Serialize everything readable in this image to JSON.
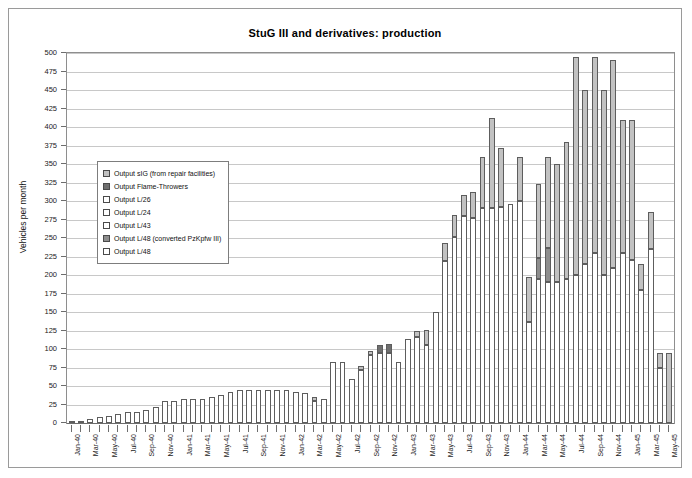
{
  "chart_data": {
    "type": "bar",
    "stacked": true,
    "title": "StuG III and derivatives: production",
    "xlabel": "",
    "ylabel": "Vehicles per month",
    "ylim": [
      0,
      500
    ],
    "ytick_step": 25,
    "yticks": [
      0,
      25,
      50,
      75,
      100,
      125,
      150,
      175,
      200,
      225,
      250,
      275,
      300,
      325,
      350,
      375,
      400,
      425,
      450,
      475,
      500
    ],
    "grid": true,
    "legend_position": "inside-left",
    "xtick_interval": 2,
    "categories": [
      "Jan-40",
      "Feb-40",
      "Mar-40",
      "Apr-40",
      "May-40",
      "Jun-40",
      "Jul-40",
      "Aug-40",
      "Sep-40",
      "Oct-40",
      "Nov-40",
      "Dec-40",
      "Jan-41",
      "Feb-41",
      "Mar-41",
      "Apr-41",
      "May-41",
      "Jun-41",
      "Jul-41",
      "Aug-41",
      "Sep-41",
      "Oct-41",
      "Nov-41",
      "Dec-41",
      "Jan-42",
      "Feb-42",
      "Mar-42",
      "Apr-42",
      "May-42",
      "Jun-42",
      "Jul-42",
      "Aug-42",
      "Sep-42",
      "Oct-42",
      "Nov-42",
      "Dec-42",
      "Jan-43",
      "Feb-43",
      "Mar-43",
      "Apr-43",
      "May-43",
      "Jun-43",
      "Jul-43",
      "Aug-43",
      "Sep-43",
      "Oct-43",
      "Nov-43",
      "Dec-43",
      "Jan-44",
      "Feb-44",
      "Mar-44",
      "Apr-44",
      "May-44",
      "Jun-44",
      "Jul-44",
      "Aug-44",
      "Sep-44",
      "Oct-44",
      "Nov-44",
      "Dec-44",
      "Jan-45",
      "Feb-45",
      "Mar-45",
      "Apr-45",
      "May-45"
    ],
    "series": [
      {
        "name": "Output L/48",
        "key": "l48",
        "fill": "#ffffff",
        "values": [
          2,
          3,
          5,
          8,
          10,
          12,
          15,
          15,
          18,
          22,
          30,
          30,
          32,
          32,
          32,
          35,
          38,
          42,
          45,
          45,
          45,
          45,
          45,
          45,
          42,
          40,
          30,
          32,
          82,
          83,
          60,
          72,
          92,
          95,
          95,
          83,
          113,
          116,
          106,
          150,
          219,
          251,
          280,
          277,
          290,
          290,
          292,
          296,
          300,
          137,
          195,
          190,
          190,
          195,
          200,
          215,
          230,
          200,
          210,
          230,
          220,
          180,
          235,
          75,
          0
        ]
      },
      {
        "name": "Output L/48 (converted PzKpfw III)",
        "key": "l48conv",
        "fill": "#8d8d8d",
        "values": [
          0,
          0,
          0,
          0,
          0,
          0,
          0,
          0,
          0,
          0,
          0,
          0,
          0,
          0,
          0,
          0,
          0,
          0,
          0,
          0,
          0,
          0,
          0,
          0,
          0,
          0,
          0,
          0,
          0,
          0,
          0,
          0,
          0,
          0,
          0,
          0,
          0,
          0,
          0,
          0,
          0,
          0,
          0,
          0,
          0,
          0,
          0,
          0,
          0,
          0,
          28,
          47,
          0,
          0,
          0,
          0,
          0,
          0,
          0,
          0,
          0,
          0,
          0,
          0,
          0
        ]
      },
      {
        "name": "Output L/43",
        "key": "l43",
        "fill": "#ffffff",
        "values": [
          0,
          0,
          0,
          0,
          0,
          0,
          0,
          0,
          0,
          0,
          0,
          0,
          0,
          0,
          0,
          0,
          0,
          0,
          0,
          0,
          0,
          0,
          0,
          0,
          0,
          0,
          0,
          0,
          0,
          0,
          0,
          0,
          0,
          0,
          0,
          0,
          0,
          0,
          0,
          0,
          0,
          0,
          0,
          0,
          0,
          0,
          0,
          0,
          0,
          0,
          0,
          0,
          0,
          0,
          0,
          0,
          0,
          0,
          0,
          0,
          0,
          0,
          0,
          0,
          0
        ]
      },
      {
        "name": "Output L/24",
        "key": "l24",
        "fill": "#ffffff",
        "values": [
          0,
          0,
          0,
          0,
          0,
          0,
          0,
          0,
          0,
          0,
          0,
          0,
          0,
          0,
          0,
          0,
          0,
          0,
          0,
          0,
          0,
          0,
          0,
          0,
          0,
          0,
          0,
          0,
          0,
          0,
          0,
          0,
          0,
          0,
          0,
          0,
          0,
          0,
          0,
          0,
          0,
          0,
          0,
          0,
          0,
          0,
          0,
          0,
          0,
          0,
          0,
          0,
          0,
          0,
          0,
          0,
          0,
          0,
          0,
          0,
          0,
          0,
          0,
          0,
          0
        ]
      },
      {
        "name": "Output L/26",
        "key": "l26",
        "fill": "#ffffff",
        "values": [
          0,
          0,
          0,
          0,
          0,
          0,
          0,
          0,
          0,
          0,
          0,
          0,
          0,
          0,
          0,
          0,
          0,
          0,
          0,
          0,
          0,
          0,
          0,
          0,
          0,
          0,
          0,
          0,
          0,
          0,
          0,
          0,
          0,
          0,
          0,
          0,
          0,
          0,
          0,
          0,
          0,
          0,
          0,
          0,
          0,
          0,
          0,
          0,
          0,
          0,
          0,
          0,
          0,
          0,
          0,
          0,
          0,
          0,
          0,
          0,
          0,
          0,
          0,
          0,
          0
        ]
      },
      {
        "name": "Output Flame-Throwers",
        "key": "flame",
        "fill": "#6f6f6f",
        "values": [
          0,
          0,
          0,
          0,
          0,
          0,
          0,
          0,
          0,
          0,
          0,
          0,
          0,
          0,
          0,
          0,
          0,
          0,
          0,
          0,
          0,
          0,
          0,
          0,
          0,
          0,
          0,
          0,
          0,
          0,
          0,
          0,
          0,
          10,
          12,
          0,
          0,
          0,
          0,
          0,
          0,
          0,
          0,
          0,
          0,
          0,
          0,
          0,
          0,
          0,
          0,
          0,
          0,
          0,
          0,
          0,
          0,
          0,
          0,
          0,
          0,
          0,
          0,
          0,
          0
        ]
      },
      {
        "name": "Output sIG (from repair facilities)",
        "key": "sig",
        "fill": "#c2c2c2",
        "values": [
          0,
          0,
          0,
          0,
          0,
          0,
          0,
          0,
          0,
          0,
          0,
          0,
          0,
          0,
          0,
          0,
          0,
          0,
          0,
          0,
          0,
          0,
          0,
          0,
          0,
          0,
          5,
          0,
          0,
          0,
          0,
          5,
          5,
          0,
          0,
          0,
          0,
          8,
          20,
          0,
          24,
          30,
          28,
          35,
          70,
          122,
          80,
          0,
          60,
          60,
          100,
          123,
          160,
          185,
          295,
          235,
          265,
          250,
          280,
          180,
          190,
          35,
          50,
          20,
          95
        ]
      }
    ],
    "legend": [
      {
        "label": "Output sIG (from repair facilities)",
        "swatch": "#c2c2c2"
      },
      {
        "label": "Output Flame-Throwers",
        "swatch": "#6f6f6f"
      },
      {
        "label": "Output L/26",
        "swatch": "#ffffff"
      },
      {
        "label": "Output L/24",
        "swatch": "#ffffff"
      },
      {
        "label": "Output L/43",
        "swatch": "#ffffff"
      },
      {
        "label": "Output L/48 (converted PzKpfw III)",
        "swatch": "#8d8d8d"
      },
      {
        "label": "Output L/48",
        "swatch": "#ffffff"
      }
    ]
  }
}
